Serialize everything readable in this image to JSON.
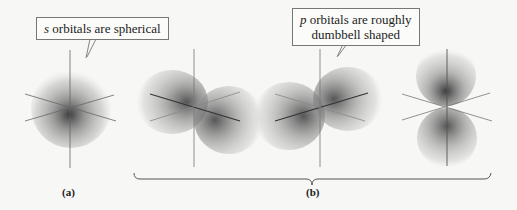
{
  "callouts": {
    "s": {
      "letter": "s",
      "text": " orbitals are spherical"
    },
    "p": {
      "letter": "p",
      "line1": " orbitals are roughly",
      "line2": "dumbbell shaped"
    }
  },
  "panels": {
    "a": {
      "label": "(a)",
      "orbital": "s orbital"
    },
    "b": {
      "label": "(b)",
      "orbitals": [
        "p orbital (x)",
        "p orbital (y)",
        "p orbital (z)"
      ]
    }
  },
  "colors": {
    "background": "#f7f7f5",
    "axis": "#555555",
    "orbital": "#555555"
  }
}
